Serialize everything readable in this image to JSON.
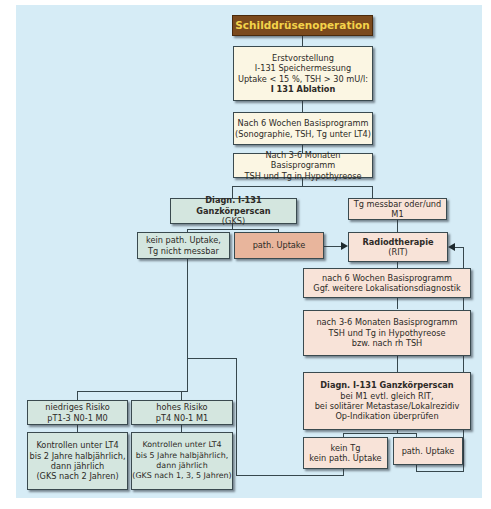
{
  "title": "Schilddrüsenoperation",
  "colors": {
    "background_panel": "#d6ecf6",
    "title_bg": "#7b4a1d",
    "title_text": "#f3d34a",
    "cream_box": "#fbf6e3",
    "green_box": "#d4e6df",
    "pink_box": "#f8e3d8",
    "salmon_box": "#e8b59c",
    "line": "#37474d"
  },
  "nodes": {
    "erstvorstellung": {
      "line1": "Erstvorstellung",
      "line2": "I-131 Speichermessung",
      "line3": "Uptake < 15 %, TSH > 30 mU/l:",
      "line4": "I 131 Ablation"
    },
    "basis6w": {
      "line1": "Nach 6 Wochen Basisprogramm",
      "line2": "(Sonographie, TSH, Tg unter LT4)"
    },
    "basis36m": {
      "line1": "Nach 3-6 Monaten Basisprogramm",
      "line2": "TSH und Tg in Hypothyreose"
    },
    "gks": {
      "line1": "Diagn. I-131 Ganzkörperscan",
      "line2": "(GKS)"
    },
    "tg_messbar": {
      "line1": "Tg messbar oder/und M1"
    },
    "kein_path": {
      "line1": "kein path. Uptake,",
      "line2": "Tg nicht messbar"
    },
    "path_uptake_1": {
      "line1": "path. Uptake"
    },
    "rit": {
      "line1": "Radiodtherapie",
      "line2": "(RIT)"
    },
    "rit_6w": {
      "line1": "nach 6 Wochen Basisprogramm",
      "line2": "Ggf. weitere Lokalisationsdiagnostik"
    },
    "rit_36m": {
      "line1": "nach 3-6 Monaten Basisprogramm",
      "line2": "TSH und Tg in Hypothyreose",
      "line3": "bzw. nach rh TSH"
    },
    "rit_gks": {
      "line1": "Diagn. I-131 Ganzkörperscan",
      "line2": "bei M1 evtl. gleich RIT,",
      "line3": "bei solitärer Metastase/Lokalrezidiv",
      "line4": "Op-Indikation überprüfen"
    },
    "kein_tg": {
      "line1": "kein Tg",
      "line2": "kein path. Uptake"
    },
    "path_uptake_2": {
      "line1": "path. Uptake"
    },
    "niedriges_risiko": {
      "line1": "niedriges Risiko",
      "line2": "pT1-3 N0-1 M0"
    },
    "hohes_risiko": {
      "line1": "hohes Risiko",
      "line2": "pT4 N0-1 M1"
    },
    "kontrollen_niedrig": {
      "line1": "Kontrollen unter LT4",
      "line2": "bis 2 Jahre halbjährlich,",
      "line3": "dann jährlich",
      "line4": "(GKS nach 2 Jahren)"
    },
    "kontrollen_hoch": {
      "line1": "Kontrollen unter LT4",
      "line2": "bis 5 Jahre halbjährlich,",
      "line3": "dann jährlich",
      "line4": "(GKS nach 1, 3, 5 Jahren)"
    }
  },
  "edges": [
    [
      "title",
      "erstvorstellung"
    ],
    [
      "erstvorstellung",
      "basis6w"
    ],
    [
      "basis6w",
      "basis36m"
    ],
    [
      "basis36m",
      "gks"
    ],
    [
      "basis36m",
      "tg_messbar"
    ],
    [
      "gks",
      "kein_path"
    ],
    [
      "gks",
      "path_uptake_1"
    ],
    [
      "path_uptake_1",
      "rit"
    ],
    [
      "tg_messbar",
      "rit"
    ],
    [
      "rit",
      "rit_6w"
    ],
    [
      "rit_6w",
      "rit_36m"
    ],
    [
      "rit_36m",
      "rit_gks"
    ],
    [
      "rit_gks",
      "kein_tg"
    ],
    [
      "rit_gks",
      "path_uptake_2"
    ],
    [
      "path_uptake_2",
      "rit"
    ],
    [
      "kein_tg",
      "kein_path"
    ],
    [
      "kein_path",
      "niedriges_risiko"
    ],
    [
      "kein_path",
      "hohes_risiko"
    ],
    [
      "niedriges_risiko",
      "kontrollen_niedrig"
    ],
    [
      "hohes_risiko",
      "kontrollen_hoch"
    ]
  ]
}
